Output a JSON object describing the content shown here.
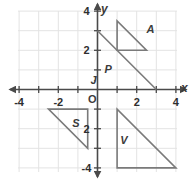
{
  "figure": {
    "title": "",
    "type": "coordinate-plane",
    "background_color": "#ffffff",
    "grid_color": "#e3e3e3",
    "axis_color": "#4a4a4a",
    "shape_color": "#7a7a7a",
    "label_color": "#3b3b3b"
  },
  "axes": {
    "x_label": "x",
    "y_label": "y",
    "origin_label": "O",
    "x_ticks": [
      {
        "value": -4,
        "label": "-4"
      },
      {
        "value": -3,
        "label": ""
      },
      {
        "value": -2,
        "label": "-2"
      },
      {
        "value": -1,
        "label": ""
      },
      {
        "value": 1,
        "label": ""
      },
      {
        "value": 2,
        "label": "2"
      },
      {
        "value": 3,
        "label": ""
      },
      {
        "value": 4,
        "label": "4"
      }
    ],
    "y_ticks": [
      {
        "value": 4,
        "label": "4"
      },
      {
        "value": 3,
        "label": ""
      },
      {
        "value": 2,
        "label": "2"
      },
      {
        "value": 1,
        "label": ""
      },
      {
        "value": -1,
        "label": ""
      },
      {
        "value": -2,
        "label": "2"
      },
      {
        "value": -3,
        "label": ""
      },
      {
        "value": -4,
        "label": "-4"
      }
    ],
    "x_range": [
      -4.4,
      4.4
    ],
    "y_range": [
      -4.4,
      4.4
    ],
    "grid": true
  },
  "chart_data": {
    "type": "scatter",
    "title": "",
    "xlabel": "x",
    "ylabel": "y",
    "xlim": [
      -4.4,
      4.4
    ],
    "ylim": [
      -4.4,
      4.4
    ],
    "grid": true,
    "shapes": [
      {
        "name": "A",
        "label": "A",
        "kind": "triangle",
        "vertices": [
          [
            1,
            2
          ],
          [
            1,
            3.5
          ],
          [
            2.5,
            2
          ]
        ],
        "label_position": [
          2.7,
          3.1
        ]
      },
      {
        "name": "P",
        "label": "P",
        "kind": "segment",
        "vertices": [
          [
            0,
            3
          ],
          [
            3,
            0
          ]
        ],
        "label_position": [
          0.55,
          1.05
        ]
      },
      {
        "name": "S",
        "label": "S",
        "kind": "triangle",
        "vertices": [
          [
            -2.5,
            -1
          ],
          [
            -0.5,
            -1
          ],
          [
            -0.5,
            -3
          ]
        ],
        "label_position": [
          -1.1,
          -1.7
        ]
      },
      {
        "name": "V",
        "label": "V",
        "kind": "triangle",
        "vertices": [
          [
            1,
            -1
          ],
          [
            1,
            -4
          ],
          [
            4,
            -4
          ]
        ],
        "label_position": [
          1.35,
          -2.6
        ]
      }
    ],
    "points": [
      {
        "name": "J",
        "label": "J",
        "x": -0.15,
        "y": 0.45
      }
    ]
  }
}
